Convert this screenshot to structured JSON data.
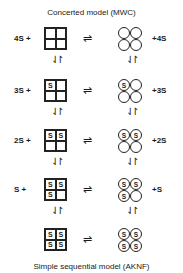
{
  "title_top": "Concerted model (MWC)",
  "title_bottom": "Simple sequential model (AKNF)",
  "equilibrium_symbol": "⇌",
  "vertical_symbol": "⇃↾",
  "rows": [
    {
      "left_label": "4S +",
      "right_label": "+4S",
      "square_cells": [
        "",
        "",
        "",
        ""
      ],
      "circle_cells": [
        "",
        "",
        "",
        ""
      ]
    },
    {
      "left_label": "3S +",
      "right_label": "+3S",
      "square_cells": [
        "S",
        "",
        "",
        ""
      ],
      "circle_cells": [
        "S",
        "",
        "",
        ""
      ]
    },
    {
      "left_label": "2S +",
      "right_label": "+2S",
      "square_cells": [
        "S",
        "S",
        "",
        ""
      ],
      "circle_cells": [
        "S",
        "S",
        "",
        ""
      ]
    },
    {
      "left_label": "S +",
      "right_label": "+S",
      "square_cells": [
        "S",
        "S",
        "S",
        ""
      ],
      "circle_cells": [
        "S",
        "S",
        "S",
        ""
      ]
    },
    {
      "left_label": "",
      "right_label": "",
      "square_cells": [
        "S",
        "S",
        "S",
        "S"
      ],
      "circle_cells": [
        "S",
        "S",
        "S",
        "S"
      ]
    }
  ]
}
